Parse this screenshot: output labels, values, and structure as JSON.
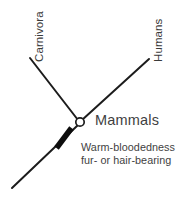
{
  "diagram": {
    "type": "cladogram",
    "title_visible": false,
    "background_color": "#ffffff",
    "line_color": "#1c1c1c",
    "text_color": "#3f3f3f",
    "tips": [
      {
        "id": "carnivora",
        "label": "Carnivora",
        "orientation": "vertical-bottom-to-top",
        "branch": {
          "from": [
            80,
            122
          ],
          "to": [
            30,
            58
          ]
        }
      },
      {
        "id": "humans",
        "label": "Humans",
        "orientation": "vertical-bottom-to-top",
        "branch": {
          "from": [
            80,
            122
          ],
          "to": [
            149,
            59
          ]
        }
      }
    ],
    "node": {
      "id": "mammals-node",
      "label": "Mammals",
      "marker": "open-circle",
      "position": [
        80,
        122
      ],
      "radius": 4.2
    },
    "stem": {
      "from": [
        80,
        122
      ],
      "to": [
        12,
        188
      ]
    },
    "character_mark": {
      "type": "tick-bar",
      "position": [
        64,
        138
      ],
      "length": 21,
      "thickness": 5.5,
      "angle_deg": -48
    },
    "trait_caption": {
      "line1": "Warm-bloodedness",
      "line2": "fur- or hair-bearing"
    }
  }
}
